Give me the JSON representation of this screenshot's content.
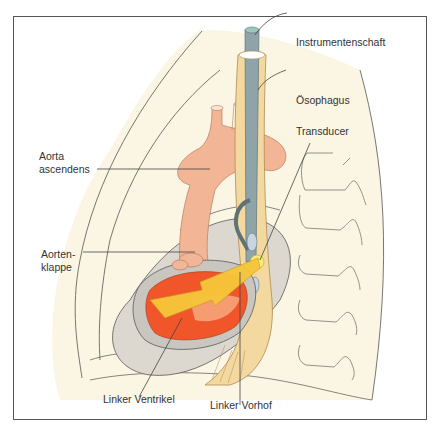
{
  "figure": {
    "type": "anatomical illustration",
    "labels": {
      "instrument_shaft": "Instrumentenschaft",
      "esophagus": "Ösophagus",
      "transducer": "Transducer",
      "aorta_ascendens_line1": "Aorta",
      "aorta_ascendens_line2": "ascendens",
      "aortic_valve_line1": "Aorten-",
      "aortic_valve_line2": "klappe",
      "left_ventricle": "Linker Ventrikel",
      "left_atrium": "Linker Vorhof"
    },
    "colors": {
      "thorax_fill": "#fbf6e3",
      "esophagus_fill": "#f3d9a0",
      "shaft_fill": "#8fa4a8",
      "shaft_tip": "#7fb3a8",
      "aorta_fill": "#f2b595",
      "pericardium_fill": "#dcd8d0",
      "ventricle_fill": "#f0562a",
      "beam_fill": "#f7c63a",
      "outline": "#555555"
    }
  }
}
